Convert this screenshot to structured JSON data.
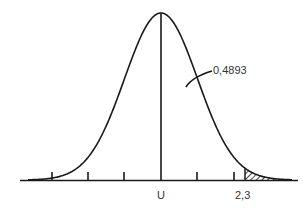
{
  "chart_data": {
    "type": "area",
    "title": "",
    "xlabel": "",
    "ylabel": "",
    "axis_labels": {
      "center": "U",
      "shade_start": "2,3"
    },
    "annotation": {
      "text": "0,4893",
      "refers_to": "area between mean and 2,3"
    },
    "shaded_region": {
      "from": 2.3,
      "to": "inf",
      "pattern": "hatched"
    },
    "tick_count": 6,
    "grid": false,
    "legend": "none"
  },
  "colors": {
    "line": "#1a1a1a",
    "text": "#333333",
    "background": "#ffffff"
  }
}
